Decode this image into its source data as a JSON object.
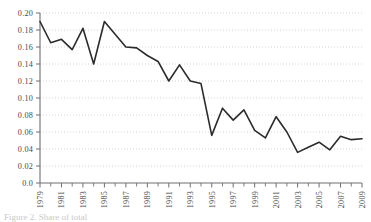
{
  "figure": {
    "background": "#ffffff",
    "line_color": "#2b2b2b",
    "grid_color": "#c9c9cf",
    "axis_color": "#6f6f75",
    "text_color": "#4a4a4a",
    "caption_fragment": "Figure 2. Share of total"
  },
  "chart_data": {
    "type": "line",
    "title": "",
    "subtitle": "",
    "xlabel": "",
    "ylabel": "",
    "legend": [],
    "legend_position": "none",
    "grid": true,
    "grid_axis": "y",
    "grid_style": "dotted",
    "xlim": [
      1979,
      2009
    ],
    "ylim": [
      0.0,
      0.2
    ],
    "ytick_labels": [
      "0.0",
      "0.02",
      "0.04",
      "0.06",
      "0.08",
      "0.10",
      "0.12",
      "0.14",
      "0.16",
      "0.18",
      "0.20"
    ],
    "ytick_values": [
      0.0,
      0.02,
      0.04,
      0.06,
      0.08,
      0.1,
      0.12,
      0.14,
      0.16,
      0.18,
      0.2
    ],
    "xtick_labels": [
      "1979",
      "1981",
      "1983",
      "1985",
      "1987",
      "1989",
      "1991",
      "1993",
      "1995",
      "1997",
      "1999",
      "2001",
      "2003",
      "2005",
      "2007",
      "2009"
    ],
    "xtick_values": [
      1979,
      1981,
      1983,
      1985,
      1987,
      1989,
      1991,
      1993,
      1995,
      1997,
      1999,
      2001,
      2003,
      2005,
      2007,
      2009
    ],
    "xtick_minor_values": [
      1980,
      1982,
      1984,
      1986,
      1988,
      1990,
      1992,
      1994,
      1996,
      1998,
      2000,
      2002,
      2004,
      2006,
      2008
    ],
    "x": [
      1979,
      1980,
      1981,
      1982,
      1983,
      1984,
      1985,
      1986,
      1987,
      1988,
      1989,
      1990,
      1991,
      1992,
      1993,
      1994,
      1995,
      1996,
      1997,
      1998,
      1999,
      2000,
      2001,
      2002,
      2003,
      2004,
      2005,
      2006,
      2007,
      2008,
      2009
    ],
    "values": [
      0.19,
      0.165,
      0.169,
      0.157,
      0.182,
      0.14,
      0.19,
      0.175,
      0.16,
      0.159,
      0.15,
      0.143,
      0.12,
      0.139,
      0.12,
      0.117,
      0.056,
      0.088,
      0.074,
      0.086,
      0.062,
      0.053,
      0.078,
      0.06,
      0.036,
      0.042,
      0.048,
      0.039,
      0.055,
      0.051,
      0.052
    ]
  }
}
